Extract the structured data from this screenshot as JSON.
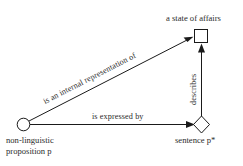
{
  "diagram": {
    "background_color": "#ffffff",
    "ink_color": "#1a1a1a",
    "text_color": "#2b2b2b",
    "nodes": [
      {
        "id": "proposition",
        "shape": "circle",
        "label_line1": "non-linguistic",
        "label_line2": "proposition p",
        "fill": "#ffffff",
        "stroke": "#1a1a1a"
      },
      {
        "id": "state-of-affairs",
        "shape": "square",
        "label": "a state of affairs",
        "fill": "#ffffff",
        "stroke": "#1a1a1a"
      },
      {
        "id": "sentence",
        "shape": "diamond",
        "label_text": "sentence p",
        "label_star": "*",
        "fill": "#ffffff",
        "stroke": "#1a1a1a"
      }
    ],
    "edges": [
      {
        "id": "representation",
        "from": "proposition",
        "to": "state-of-affairs",
        "label": "is an internal representation of",
        "orientation": "diagonal",
        "arrow": "to"
      },
      {
        "id": "expression",
        "from": "proposition",
        "to": "sentence",
        "label": "is expressed by",
        "orientation": "horizontal",
        "arrow": "to"
      },
      {
        "id": "description",
        "from": "sentence",
        "to": "state-of-affairs",
        "label": "describes",
        "orientation": "vertical",
        "arrow": "to"
      }
    ]
  }
}
